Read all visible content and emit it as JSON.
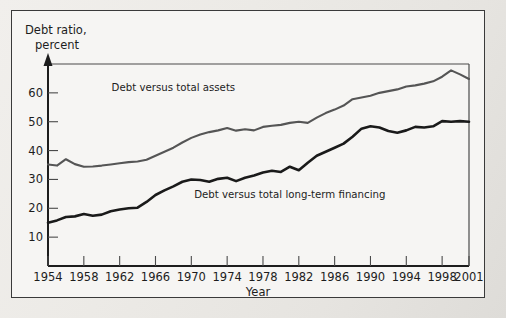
{
  "figure": {
    "y_axis_title_line1": "Debt ratio,",
    "y_axis_title_line2": "percent",
    "x_axis_label": "Year"
  },
  "chart_data": {
    "type": "line",
    "title": "",
    "subtitle": "",
    "xlabel": "Year",
    "ylabel": "Debt ratio, percent",
    "xlim": [
      1954,
      2001
    ],
    "ylim": [
      0,
      70
    ],
    "grid": false,
    "legend_position": "inline-annotations",
    "y_ticks": [
      10,
      20,
      30,
      40,
      50,
      60
    ],
    "x_ticks": [
      1954,
      1958,
      1962,
      1966,
      1970,
      1974,
      1978,
      1982,
      1986,
      1990,
      1994,
      1998,
      2001
    ],
    "x_tick_labels": [
      "1954",
      "1958",
      "1962",
      "1966",
      "1970",
      "1974",
      "1978",
      "1982",
      "1986",
      "1990",
      "1994",
      "1998",
      "2001"
    ],
    "annotations": [
      {
        "text": "Debt versus total assets",
        "x": 1968,
        "y": 60.5
      },
      {
        "text": "Debt versus total long-term financing",
        "x": 1981,
        "y": 23.5
      }
    ],
    "x": [
      1954,
      1955,
      1956,
      1957,
      1958,
      1959,
      1960,
      1961,
      1962,
      1963,
      1964,
      1965,
      1966,
      1967,
      1968,
      1969,
      1970,
      1971,
      1972,
      1973,
      1974,
      1975,
      1976,
      1977,
      1978,
      1979,
      1980,
      1981,
      1982,
      1983,
      1984,
      1985,
      1986,
      1987,
      1988,
      1989,
      1990,
      1991,
      1992,
      1993,
      1994,
      1995,
      1996,
      1997,
      1998,
      1999,
      2000,
      2001
    ],
    "series": [
      {
        "name": "Debt versus total assets",
        "color": "#555555",
        "values": [
          35.2,
          34.8,
          37.0,
          35.3,
          34.4,
          34.5,
          34.8,
          35.2,
          35.6,
          36.0,
          36.2,
          36.8,
          38.2,
          39.6,
          41.0,
          42.8,
          44.4,
          45.6,
          46.4,
          47.0,
          47.8,
          46.9,
          47.4,
          47.0,
          48.2,
          48.6,
          48.9,
          49.6,
          50.0,
          49.6,
          51.4,
          53.0,
          54.2,
          55.6,
          57.8,
          58.4,
          59.0,
          60.0,
          60.6,
          61.2,
          62.2,
          62.6,
          63.2,
          64.0,
          65.6,
          67.8,
          66.4,
          64.8
        ]
      },
      {
        "name": "Debt versus total long-term financing",
        "color": "#1a1a1a",
        "values": [
          15.0,
          15.8,
          17.0,
          17.2,
          18.0,
          17.4,
          17.8,
          19.0,
          19.6,
          20.0,
          20.2,
          22.2,
          24.6,
          26.2,
          27.6,
          29.2,
          30.0,
          29.8,
          29.2,
          30.2,
          30.6,
          29.4,
          30.6,
          31.4,
          32.4,
          33.0,
          32.6,
          34.4,
          33.2,
          35.8,
          38.2,
          39.6,
          41.0,
          42.4,
          44.8,
          47.6,
          48.4,
          48.0,
          46.8,
          46.2,
          47.0,
          48.2,
          48.0,
          48.4,
          50.2,
          50.0,
          50.2,
          50.0
        ]
      }
    ]
  }
}
